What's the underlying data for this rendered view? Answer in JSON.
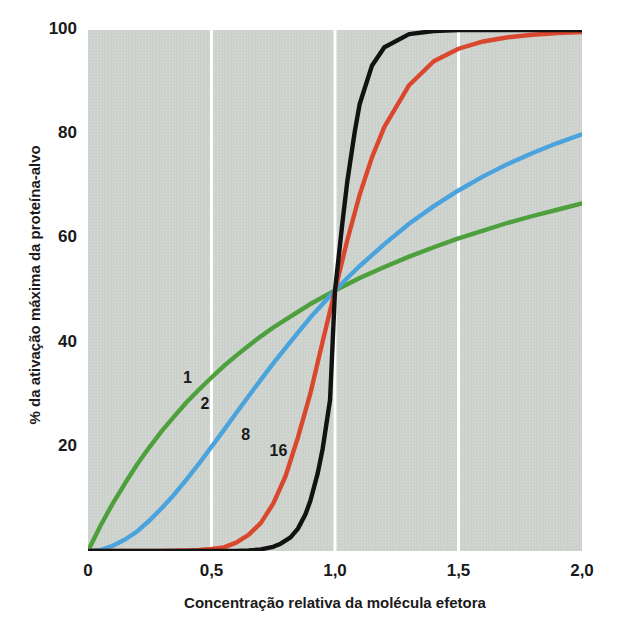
{
  "chart_data": {
    "type": "line",
    "title": "",
    "xlabel": "Concentração relativa da molécula efetora",
    "ylabel": "% da ativação máxima da proteína-alvo",
    "xlim": [
      0,
      2.0
    ],
    "ylim": [
      0,
      100
    ],
    "xticks": [
      "0",
      "0,5",
      "1,0",
      "1,5",
      "2,0"
    ],
    "xtick_values": [
      0,
      0.5,
      1.0,
      1.5,
      2.0
    ],
    "yticks": [
      "20",
      "40",
      "60",
      "80",
      "100"
    ],
    "ytick_values": [
      20,
      40,
      60,
      80,
      100
    ],
    "grid": "vertical-white-gridlines",
    "legend": "inline-curve-labels",
    "plot_background": "#ccd1cc",
    "series": [
      {
        "name": "1",
        "hill_coefficient": 1,
        "color": "#4da03c",
        "label_x": 0.385,
        "label_y": 33,
        "x": [
          0.0,
          0.05,
          0.1,
          0.15,
          0.2,
          0.25,
          0.3,
          0.35,
          0.4,
          0.45,
          0.5,
          0.55,
          0.6,
          0.65,
          0.7,
          0.75,
          0.8,
          0.85,
          0.9,
          0.95,
          1.0,
          1.05,
          1.1,
          1.2,
          1.3,
          1.4,
          1.5,
          1.6,
          1.7,
          1.8,
          1.9,
          2.0
        ],
        "y": [
          0.0,
          4.8,
          9.1,
          13.0,
          16.7,
          20.0,
          23.1,
          25.9,
          28.6,
          31.0,
          33.3,
          35.5,
          37.5,
          39.4,
          41.2,
          42.9,
          44.4,
          45.9,
          47.4,
          48.7,
          50.0,
          51.2,
          52.4,
          54.5,
          56.5,
          58.3,
          60.0,
          61.5,
          63.0,
          64.3,
          65.5,
          66.7
        ]
      },
      {
        "name": "2",
        "hill_coefficient": 2,
        "color": "#4aa3dc",
        "label_x": 0.455,
        "label_y": 28,
        "x": [
          0.0,
          0.05,
          0.1,
          0.15,
          0.2,
          0.25,
          0.3,
          0.35,
          0.4,
          0.45,
          0.5,
          0.55,
          0.6,
          0.65,
          0.7,
          0.75,
          0.8,
          0.85,
          0.9,
          0.95,
          1.0,
          1.05,
          1.1,
          1.2,
          1.3,
          1.4,
          1.5,
          1.6,
          1.7,
          1.8,
          1.9,
          2.0
        ],
        "y": [
          0.0,
          0.2,
          1.0,
          2.2,
          3.8,
          5.9,
          8.3,
          10.9,
          13.8,
          16.8,
          20.0,
          23.2,
          26.5,
          29.7,
          32.9,
          36.0,
          39.0,
          41.9,
          44.8,
          47.4,
          50.0,
          52.4,
          54.7,
          58.9,
          62.8,
          66.2,
          69.2,
          71.9,
          74.3,
          76.4,
          78.3,
          80.0
        ]
      },
      {
        "name": "8",
        "hill_coefficient": 8,
        "color": "#d9472e",
        "label_x": 0.62,
        "label_y": 22,
        "x": [
          0.0,
          0.1,
          0.2,
          0.3,
          0.4,
          0.45,
          0.5,
          0.55,
          0.6,
          0.65,
          0.7,
          0.75,
          0.8,
          0.85,
          0.9,
          0.95,
          1.0,
          1.05,
          1.1,
          1.15,
          1.2,
          1.3,
          1.4,
          1.5,
          1.6,
          1.7,
          1.8,
          1.9,
          2.0
        ],
        "y": [
          0.0,
          0.0,
          0.0,
          0.0,
          0.1,
          0.2,
          0.4,
          0.7,
          1.6,
          3.1,
          5.4,
          9.1,
          14.4,
          21.8,
          30.2,
          40.2,
          50.0,
          59.7,
          68.4,
          75.6,
          81.4,
          89.4,
          94.0,
          96.4,
          97.8,
          98.6,
          99.1,
          99.4,
          99.6
        ]
      },
      {
        "name": "16",
        "hill_coefficient": 16,
        "color": "#121212",
        "label_x": 0.735,
        "label_y": 19,
        "x": [
          0.0,
          0.2,
          0.4,
          0.55,
          0.6,
          0.65,
          0.7,
          0.75,
          0.78,
          0.82,
          0.85,
          0.88,
          0.9,
          0.93,
          0.95,
          0.98,
          1.0,
          1.03,
          1.05,
          1.08,
          1.1,
          1.15,
          1.2,
          1.3,
          1.4,
          1.5,
          1.7,
          2.0
        ],
        "y": [
          0.0,
          0.0,
          0.0,
          0.0,
          0.0,
          0.1,
          0.3,
          0.8,
          1.4,
          2.6,
          4.3,
          7.0,
          9.6,
          14.9,
          19.6,
          29.0,
          50.0,
          63.0,
          71.0,
          80.5,
          85.8,
          93.2,
          96.7,
          99.2,
          99.8,
          100.0,
          100.0,
          100.0
        ]
      }
    ]
  },
  "plot": {
    "left_px": 88,
    "right_px": 582,
    "top_px": 30,
    "bottom_px": 551
  }
}
